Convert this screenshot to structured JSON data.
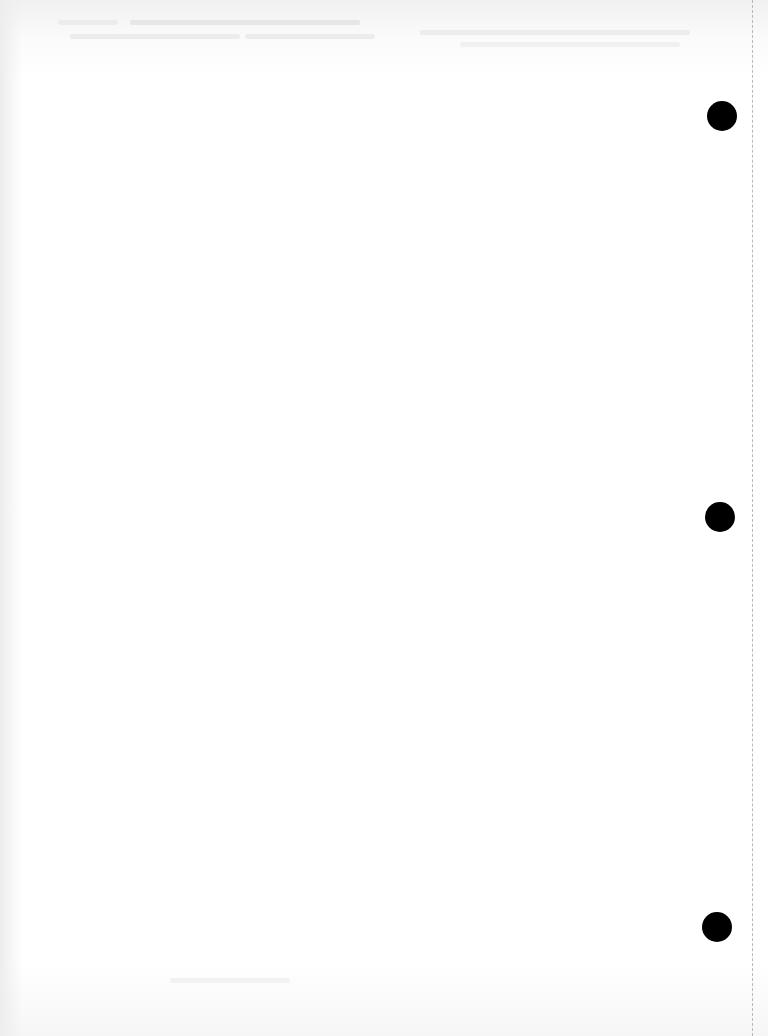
{
  "document": {
    "type": "blank scanned page",
    "background_color": "#ffffff",
    "hole_punches": [
      {
        "x": 707,
        "y": 101,
        "diameter": 30,
        "color": "#000000"
      },
      {
        "x": 705,
        "y": 502,
        "diameter": 30,
        "color": "#000000"
      },
      {
        "x": 702,
        "y": 912,
        "diameter": 30,
        "color": "#000000"
      }
    ],
    "perforation_line": {
      "x": 752,
      "style": "dashed",
      "color": "#b8b8b8"
    },
    "bleed_through_text": "illegible"
  }
}
